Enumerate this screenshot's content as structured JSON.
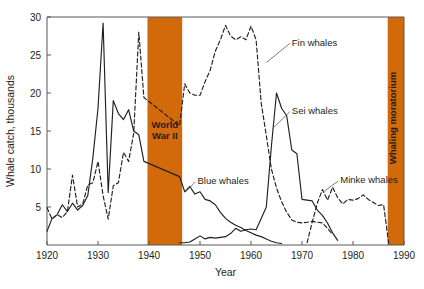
{
  "chart_data": {
    "type": "line",
    "title": "",
    "xlabel": "Year",
    "ylabel": "Whale catch, thousands",
    "xlim": [
      1920,
      1990
    ],
    "ylim": [
      0,
      30
    ],
    "xticks": [
      1920,
      1930,
      1940,
      1950,
      1960,
      1970,
      1980,
      1990
    ],
    "yticks": [
      5,
      10,
      15,
      20,
      25,
      30
    ],
    "grid": false,
    "legend_position": "inline-annotations",
    "series": [
      {
        "name": "Blue whales",
        "style": "solid",
        "color": "#231f20",
        "x": [
          1920,
          1921,
          1922,
          1923,
          1924,
          1925,
          1926,
          1927,
          1928,
          1929,
          1930,
          1931,
          1932,
          1933,
          1934,
          1935,
          1936,
          1937,
          1938,
          1939,
          1946,
          1947,
          1948,
          1949,
          1950,
          1951,
          1952,
          1953,
          1954,
          1955,
          1956,
          1957,
          1958,
          1959,
          1960,
          1961,
          1962,
          1963,
          1964,
          1965,
          1966
        ],
        "y": [
          1.8,
          3.5,
          4.0,
          5.3,
          4.4,
          5.5,
          4.6,
          5.2,
          6.5,
          11.5,
          18.0,
          29.2,
          6.9,
          19.0,
          17.3,
          16.5,
          17.8,
          15.0,
          14.5,
          11.0,
          9.0,
          7.0,
          7.7,
          6.7,
          7.0,
          6.0,
          5.8,
          5.3,
          4.3,
          3.5,
          3.0,
          2.6,
          2.3,
          1.9,
          1.6,
          1.3,
          1.1,
          0.8,
          0.5,
          0.3,
          0.2
        ]
      },
      {
        "name": "Fin whales",
        "style": "dashed",
        "color": "#231f20",
        "x": [
          1920,
          1921,
          1922,
          1923,
          1924,
          1925,
          1926,
          1927,
          1928,
          1929,
          1930,
          1931,
          1932,
          1933,
          1934,
          1935,
          1936,
          1937,
          1938,
          1939,
          1946,
          1947,
          1948,
          1949,
          1950,
          1951,
          1952,
          1953,
          1954,
          1955,
          1956,
          1957,
          1958,
          1959,
          1960,
          1961,
          1962,
          1963,
          1964,
          1965,
          1966,
          1967,
          1968,
          1969,
          1970,
          1971,
          1972,
          1973,
          1974,
          1975,
          1976
        ],
        "y": [
          4.9,
          3.4,
          4.0,
          3.6,
          4.4,
          9.2,
          5.0,
          5.4,
          7.9,
          8.2,
          11.0,
          6.5,
          3.4,
          7.8,
          8.2,
          12.2,
          11.0,
          14.7,
          28.0,
          19.4,
          15.7,
          21.2,
          20.0,
          19.7,
          19.7,
          21.5,
          23.0,
          25.5,
          27.0,
          28.9,
          27.5,
          27.0,
          27.4,
          27.0,
          28.8,
          27.0,
          18.7,
          14.4,
          10.0,
          7.5,
          5.7,
          4.3,
          3.3,
          3.0,
          2.9,
          3.0,
          3.1,
          3.0,
          2.9,
          2.2,
          1.4
        ]
      },
      {
        "name": "Sei whales",
        "style": "solid",
        "color": "#231f20",
        "x": [
          1946,
          1947,
          1948,
          1949,
          1950,
          1951,
          1952,
          1953,
          1954,
          1955,
          1956,
          1957,
          1958,
          1959,
          1960,
          1961,
          1962,
          1963,
          1964,
          1965,
          1966,
          1967,
          1968,
          1969,
          1970,
          1971,
          1972,
          1973,
          1974,
          1975,
          1976,
          1977
        ],
        "y": [
          0.3,
          0.3,
          0.4,
          0.8,
          1.2,
          0.8,
          1.0,
          0.9,
          1.0,
          1.1,
          1.5,
          2.2,
          1.8,
          2.0,
          2.1,
          2.0,
          3.5,
          5.0,
          13.0,
          20.0,
          18.0,
          17.0,
          12.5,
          12.0,
          6.0,
          5.9,
          5.8,
          4.6,
          3.9,
          2.9,
          1.6,
          0.6
        ]
      },
      {
        "name": "Minke whales",
        "style": "dashed",
        "color": "#231f20",
        "x": [
          1971,
          1972,
          1973,
          1974,
          1975,
          1976,
          1977,
          1978,
          1979,
          1980,
          1981,
          1982,
          1983,
          1984,
          1985,
          1986,
          1987
        ],
        "y": [
          0.3,
          3.0,
          5.5,
          7.3,
          5.9,
          7.6,
          6.2,
          5.4,
          6.0,
          5.9,
          6.1,
          6.6,
          6.0,
          5.6,
          5.2,
          5.3,
          0.2
        ]
      }
    ],
    "bands": [
      {
        "name": "World War II",
        "label": "World War II",
        "label_lines": [
          "World",
          "War II"
        ],
        "x_start": 1939.7,
        "x_end": 1946.5,
        "color": "#D2690B",
        "orientation": "horizontal"
      },
      {
        "name": "Whaling moratorium",
        "label": "Whaling moratorium",
        "label_lines": [
          "Whaling moratorium"
        ],
        "x_start": 1986.8,
        "x_end": 1990.0,
        "color": "#D2690B",
        "orientation": "vertical"
      }
    ],
    "annotations": [
      {
        "text": "Fin whales",
        "x": 1968.0,
        "y": 26.2,
        "leader_to_x": 1963.0,
        "leader_to_y": 24.0,
        "anchor": "start"
      },
      {
        "text": "Sei whales",
        "x": 1968.0,
        "y": 17.2,
        "leader_to_x": 1964.2,
        "leader_to_y": 15.3,
        "anchor": "start"
      },
      {
        "text": "Blue whales",
        "x": 1949.5,
        "y": 8.0,
        "leader_to_x": 1947.2,
        "leader_to_y": 7.0,
        "anchor": "start"
      },
      {
        "text": "Minke whales",
        "x": 1977.5,
        "y": 8.1,
        "leader_to_x": 1974.2,
        "leader_to_y": 7.0,
        "anchor": "start"
      }
    ]
  },
  "footer": {
    "ghost_text": ""
  }
}
